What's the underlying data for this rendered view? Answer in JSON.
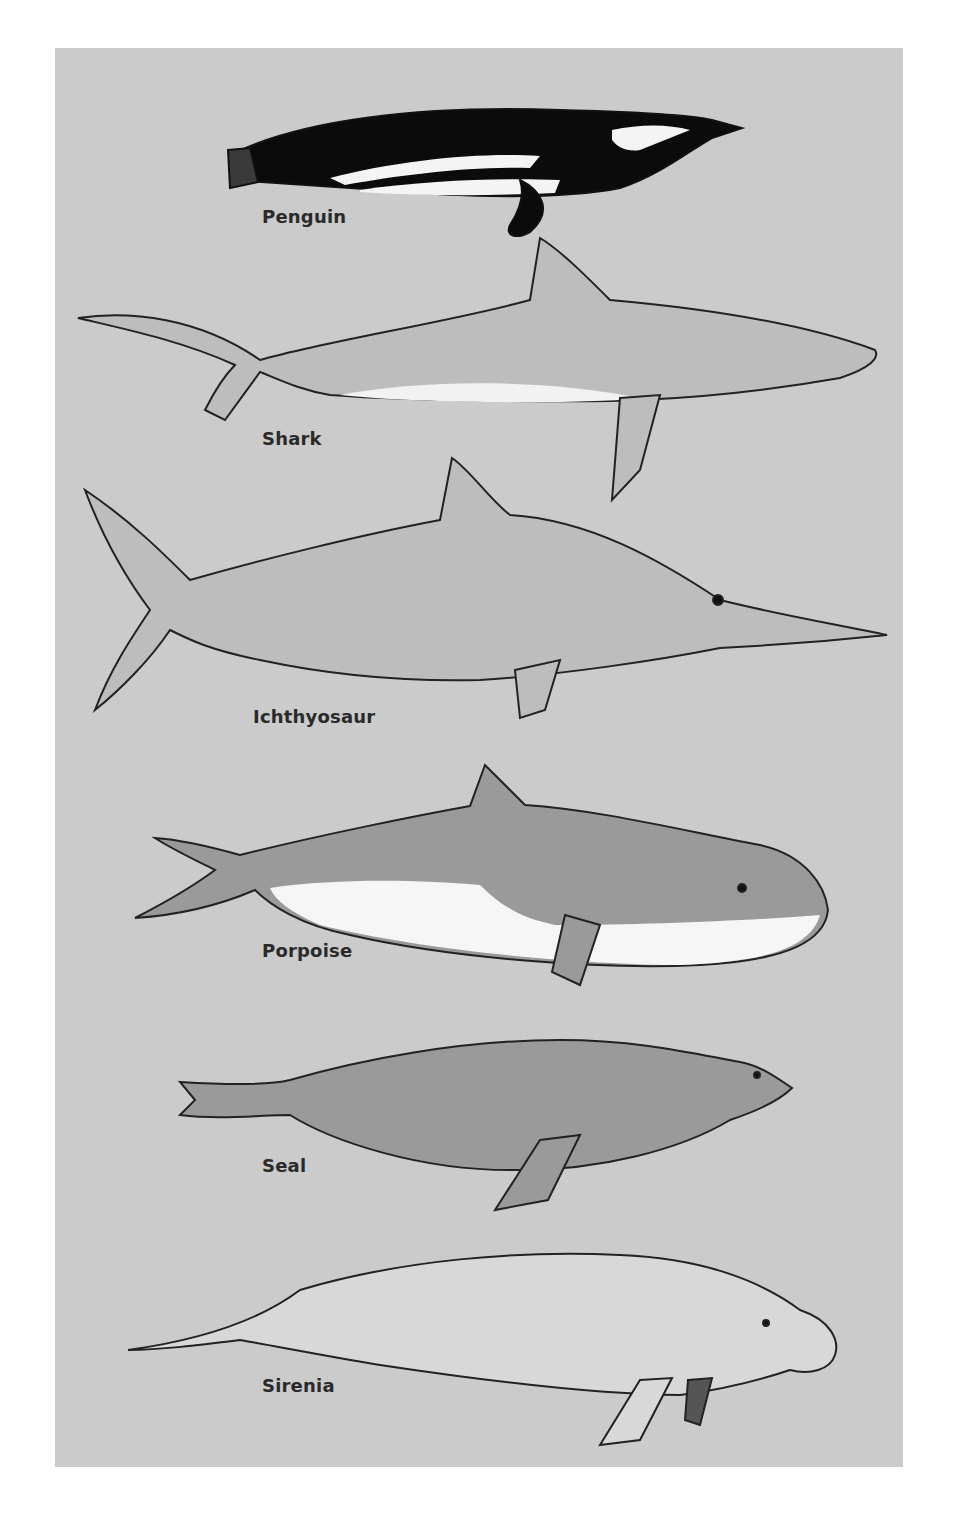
{
  "figure": {
    "title": "",
    "background": "#cbcbcb",
    "animals": [
      {
        "name": "Penguin",
        "label_x": 262,
        "label_y": 206
      },
      {
        "name": "Shark",
        "label_x": 262,
        "label_y": 428
      },
      {
        "name": "Ichthyosaur",
        "label_x": 253,
        "label_y": 706
      },
      {
        "name": "Porpoise",
        "label_x": 262,
        "label_y": 940
      },
      {
        "name": "Seal",
        "label_x": 262,
        "label_y": 1155
      },
      {
        "name": "Sirenia",
        "label_x": 262,
        "label_y": 1375
      }
    ]
  }
}
